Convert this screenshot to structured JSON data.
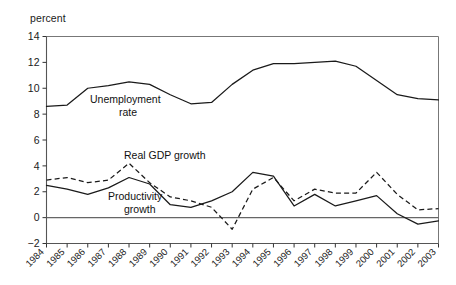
{
  "axis_unit_label": "percent",
  "chart_data": {
    "type": "line",
    "title": "",
    "subtitle": "",
    "xlabel": "",
    "ylabel": "percent",
    "ylim": [
      -2,
      14
    ],
    "yticks": [
      -2,
      0,
      2,
      4,
      6,
      8,
      10,
      12,
      14
    ],
    "ytick_labels": [
      "−2",
      "0",
      "2",
      "4",
      "6",
      "8",
      "10",
      "12",
      "14"
    ],
    "grid": false,
    "legend_position": "inline-annotations",
    "categories": [
      "1984",
      "1985",
      "1986",
      "1987",
      "1988",
      "1989",
      "1990",
      "1991",
      "1992",
      "1993",
      "1994",
      "1995",
      "1996",
      "1997",
      "1998",
      "1999",
      "2000",
      "2001",
      "2002",
      "2003"
    ],
    "x": [
      1984,
      1985,
      1986,
      1987,
      1988,
      1989,
      1990,
      1991,
      1992,
      1993,
      1994,
      1995,
      1996,
      1997,
      1998,
      1999,
      2000,
      2001,
      2002,
      2003
    ],
    "series": [
      {
        "name": "Unemployment rate",
        "style": "solid",
        "label_text_line1": "Unemployment",
        "label_text_line2": "rate",
        "values": [
          8.6,
          8.7,
          10.0,
          10.2,
          10.5,
          10.3,
          9.5,
          8.8,
          8.9,
          10.3,
          11.4,
          11.9,
          11.9,
          12.0,
          12.1,
          11.7,
          10.6,
          9.5,
          9.2,
          9.1
        ]
      },
      {
        "name": "Real GDP growth",
        "style": "dashed",
        "label_text_line1": "Real GDP growth",
        "label_text_line2": "",
        "values": [
          2.9,
          3.1,
          2.7,
          2.9,
          4.2,
          2.7,
          1.6,
          1.3,
          0.8,
          -0.9,
          2.2,
          3.1,
          1.3,
          2.2,
          1.9,
          1.9,
          3.5,
          1.8,
          0.6,
          0.7
        ]
      },
      {
        "name": "Productivity growth",
        "style": "solid",
        "label_text_line1": "Productivity",
        "label_text_line2": "growth",
        "values": [
          2.5,
          2.2,
          1.8,
          2.3,
          3.1,
          2.6,
          1.0,
          0.8,
          1.3,
          2.0,
          3.5,
          3.2,
          0.9,
          1.8,
          0.9,
          1.3,
          1.7,
          0.3,
          -0.5,
          -0.25
        ]
      }
    ],
    "annotations": [
      {
        "text": "Unemployment",
        "x_px": 90,
        "y_px": 103
      },
      {
        "text": "rate",
        "x_px": 119,
        "y_px": 116
      },
      {
        "text": "Real GDP growth",
        "x_px": 124,
        "y_px": 159
      },
      {
        "text": "Productivity",
        "x_px": 108,
        "y_px": 200
      },
      {
        "text": "growth",
        "x_px": 124,
        "y_px": 213
      }
    ]
  },
  "colors": {
    "line": "#1a1a1a",
    "axis": "#555555",
    "frame": "#777777",
    "text": "#1a1a1a",
    "background": "#ffffff"
  }
}
